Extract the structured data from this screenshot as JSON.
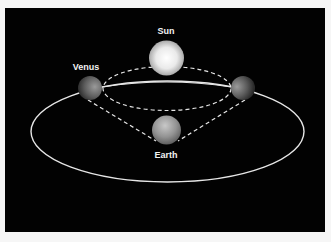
{
  "diagram": {
    "bodies": {
      "sun": {
        "label": "Sun"
      },
      "venus": {
        "label": "Venus"
      },
      "earth": {
        "label": "Earth"
      }
    },
    "colors": {
      "background": "#020202",
      "border": "#f6f6f6",
      "orbit_line": "#e6e6e6",
      "label": "#f2f2f2"
    }
  }
}
